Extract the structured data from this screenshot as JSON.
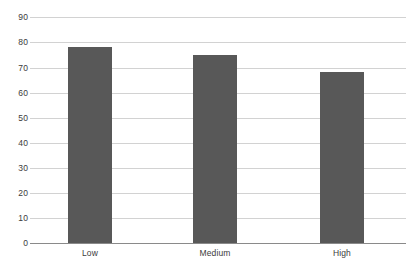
{
  "chart_data": {
    "type": "bar",
    "title": "",
    "subtitle": "",
    "xlabel": "",
    "ylabel": "",
    "categories": [
      "Low",
      "Medium",
      "High"
    ],
    "values": [
      78,
      75,
      68
    ],
    "series": [
      {
        "name": "",
        "values": [
          78,
          75,
          68
        ]
      }
    ],
    "ylim": [
      0,
      90
    ],
    "y_ticks": [
      0,
      10,
      20,
      30,
      40,
      50,
      60,
      70,
      80,
      90
    ],
    "y_tick_labels": [
      "0",
      "10",
      "20",
      "30",
      "40",
      "50",
      "60",
      "70",
      "80",
      "90"
    ],
    "grid": "horizontal",
    "legend": "none",
    "bar_color": "#585858",
    "gridline_color": "#d2d2d2",
    "axis_color": "#8a8a8a",
    "text_color": "#3b3b3b",
    "background_color": "#ffffff"
  }
}
